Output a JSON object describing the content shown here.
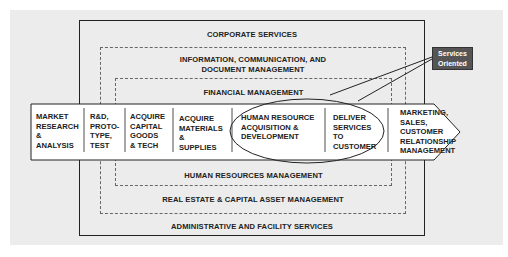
{
  "layers": {
    "corporate_services": "CORPORATE SERVICES",
    "information_mgmt_line1": "INFORMATION, COMMUNICATION, AND",
    "information_mgmt_line2": "DOCUMENT MANAGEMENT",
    "financial_mgmt": "FINANCIAL MANAGEMENT",
    "hr_mgmt": "HUMAN RESOURCES MANAGEMENT",
    "real_estate": "REAL ESTATE & CAPITAL ASSET MANAGEMENT",
    "admin_facility": "ADMINISTRATIVE AND FACILITY SERVICES"
  },
  "value_chain": {
    "steps": [
      {
        "lines": [
          "MARKET",
          "RESEARCH",
          "&",
          "ANALYSIS"
        ]
      },
      {
        "lines": [
          "R&D,",
          "PROTO-",
          "TYPE,",
          "TEST"
        ]
      },
      {
        "lines": [
          "ACQUIRE",
          "CAPITAL",
          "GOODS",
          "& TECH"
        ]
      },
      {
        "lines": [
          "ACQUIRE",
          "MATERIALS",
          "&",
          "SUPPLIES"
        ]
      },
      {
        "lines": [
          "HUMAN RESOURCE",
          "ACQUISITION &",
          "DEVELOPMENT"
        ]
      },
      {
        "lines": [
          "DELIVER",
          "SERVICES",
          "TO",
          "CUSTOMER"
        ]
      },
      {
        "lines": [
          "MARKETING,",
          "SALES,",
          "CUSTOMER",
          "RELATIONSHIP",
          "MANAGEMENT"
        ]
      }
    ]
  },
  "callout": {
    "line1": "Services",
    "line2": "Oriented",
    "color": "#555555"
  },
  "colors": {
    "background": "#ececec",
    "band_fill": "#ffffff",
    "stroke": "#222222"
  },
  "caption": "Figure 1-2: Value chain"
}
